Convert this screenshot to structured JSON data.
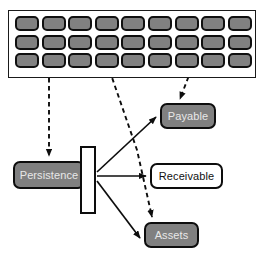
{
  "diagram": {
    "background_color": "#ffffff",
    "palette": {
      "node_fill": "#808080",
      "node_fill_text": "#e8e8e8",
      "node_outline_fill": "#ffffff",
      "node_outline_text": "#111111",
      "stroke": "#0d0d0d",
      "grid_cell_fill": "#818181",
      "panel_fill": "#ffffff"
    },
    "grid_panel": {
      "name": "grid-panel",
      "rows": 3,
      "columns": 9,
      "cell_count": 27,
      "cell_shape": "rounded-rectangle"
    },
    "nodes": [
      {
        "id": "persistence",
        "label": "Persistence",
        "style": "filled"
      },
      {
        "id": "payable",
        "label": "Payable",
        "style": "filled"
      },
      {
        "id": "receivable",
        "label": "Receivable",
        "style": "outlined"
      },
      {
        "id": "assets",
        "label": "Assets",
        "style": "filled"
      }
    ],
    "gate_bar": {
      "name": "gate-bar",
      "shape": "vertical-bar",
      "style": "outlined"
    },
    "connections": [
      {
        "from": "grid-panel",
        "to": "persistence",
        "style": "dashed",
        "arrow": "end"
      },
      {
        "from": "grid-panel",
        "to": "payable",
        "style": "dashed",
        "arrow": "end"
      },
      {
        "from": "grid-panel",
        "to": "assets",
        "style": "dashed",
        "arrow": "end"
      },
      {
        "from": "gate-bar",
        "to": "payable",
        "style": "solid",
        "arrow": "end"
      },
      {
        "from": "gate-bar",
        "to": "receivable",
        "style": "solid",
        "arrow": "end"
      },
      {
        "from": "gate-bar",
        "to": "assets",
        "style": "solid",
        "arrow": "end"
      }
    ]
  }
}
